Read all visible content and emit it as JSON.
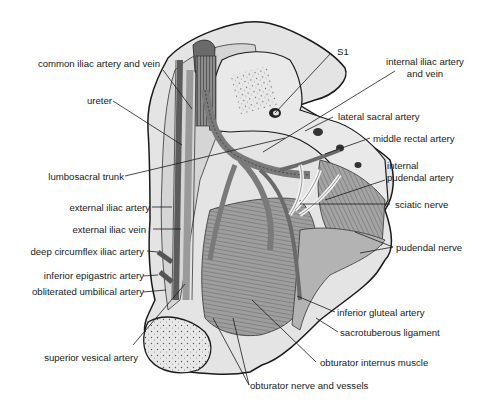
{
  "figure": {
    "colors": {
      "bone": "#e6e6e6",
      "bone_shadow": "#cfcfcf",
      "vessel": "#8a8a8a",
      "vessel_dark": "#5a5a5a",
      "muscle": "#9d9d9d",
      "nerve": "#f2f2f2",
      "outline": "#1a1a1a",
      "label_text": "#1a1a1a"
    }
  },
  "labels": {
    "left": [
      {
        "id": "common-iliac",
        "text": "common iliac artery and vein"
      },
      {
        "id": "ureter",
        "text": "ureter"
      },
      {
        "id": "lumbosacral-trunk",
        "text": "lumbosacral trunk"
      },
      {
        "id": "external-iliac-artery",
        "text": "external iliac artery"
      },
      {
        "id": "external-iliac-vein",
        "text": "external iliac vein"
      },
      {
        "id": "deep-circumflex-iliac",
        "text": "deep circumflex iliac artery"
      },
      {
        "id": "inferior-epigastric",
        "text": "inferior epigastric artery"
      },
      {
        "id": "obliterated-umbilical",
        "text": "obliterated umbilical artery"
      },
      {
        "id": "superior-vesical",
        "text": "superior vesical artery"
      }
    ],
    "right": [
      {
        "id": "s1",
        "text": "S1"
      },
      {
        "id": "internal-iliac-line1",
        "text": "internal iliac artery"
      },
      {
        "id": "internal-iliac-line2",
        "text": "and vein"
      },
      {
        "id": "lateral-sacral",
        "text": "lateral sacral artery"
      },
      {
        "id": "middle-rectal",
        "text": "middle rectal artery"
      },
      {
        "id": "internal-pudendal-line1",
        "text": "internal"
      },
      {
        "id": "internal-pudendal-line2",
        "text": "pudendal artery"
      },
      {
        "id": "sciatic-nerve",
        "text": "sciatic nerve"
      },
      {
        "id": "pudendal-nerve",
        "text": "pudendal nerve"
      },
      {
        "id": "inferior-gluteal",
        "text": "inferior gluteal artery"
      },
      {
        "id": "sacrotuberous",
        "text": "sacrotuberous ligament"
      },
      {
        "id": "obturator-internus",
        "text": "obturator internus muscle"
      },
      {
        "id": "obturator-nerve",
        "text": "obturator nerve and vessels"
      }
    ]
  }
}
